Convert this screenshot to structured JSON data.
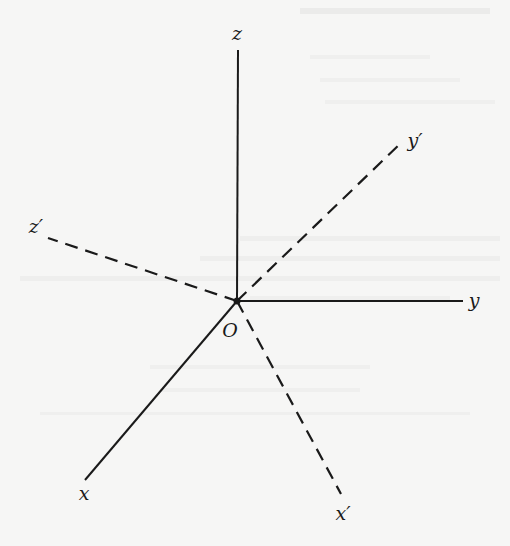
{
  "figure": {
    "origin": {
      "label": "O",
      "x": 237,
      "y": 301
    },
    "solid_axes": [
      {
        "name": "z",
        "label": "z",
        "end": [
          238,
          50
        ],
        "label_pos": [
          237,
          40
        ]
      },
      {
        "name": "y",
        "label": "y",
        "end": [
          463,
          301
        ],
        "label_pos": [
          474,
          307
        ]
      },
      {
        "name": "x",
        "label": "x",
        "end": [
          85,
          480
        ],
        "label_pos": [
          84,
          500
        ]
      }
    ],
    "dashed_axes": [
      {
        "name": "z-prime",
        "label": "z′",
        "end": [
          48,
          238
        ],
        "label_pos": [
          36,
          233
        ]
      },
      {
        "name": "y-prime",
        "label": "y′",
        "end": [
          403,
          141
        ],
        "label_pos": [
          415,
          147
        ]
      },
      {
        "name": "x-prime",
        "label": "x′",
        "end": [
          341,
          494
        ],
        "label_pos": [
          343,
          520
        ]
      }
    ],
    "colors": {
      "line": "#1a1a1a",
      "background": "#f6f6f5"
    }
  }
}
